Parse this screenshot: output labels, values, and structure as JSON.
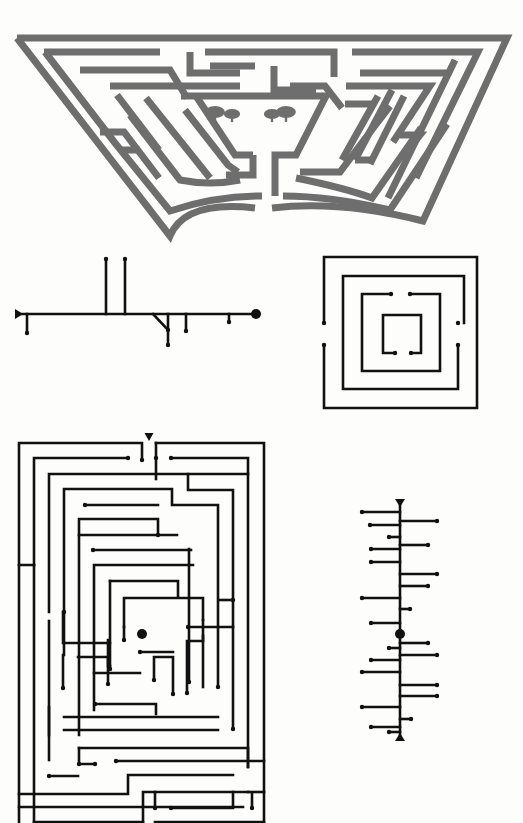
{
  "page": {
    "width": 523,
    "height": 823,
    "background": "#fdfdfc"
  },
  "colors": {
    "hedge": "#6e6e6e",
    "ink": "#111111"
  },
  "figures": [
    {
      "id": "hedge-maze-trapezoid",
      "label": "Trapezoidal hedge maze with two trees at centre",
      "stroke_width": 7,
      "paths": [
        "M17,38 L507,38 L423,221 Q340,200 272,208",
        "M255,208 Q185,200 170,236 L17,38",
        "M44,52 L160,52",
        "M190,52 L190,73 L240,73",
        "M205,52 L334,52 L334,77",
        "M274,66 L274,90 L316,90",
        "M210,66 L255,66",
        "M352,52 L478,52 L416,178",
        "M360,73 L450,73",
        "M80,70 L170,70 L187,98",
        "M45,52 L115,143 L170,211 Q215,196 262,196",
        "M283,196 Q330,196 390,210 L447,124",
        "M110,86 L240,86",
        "M290,86 L325,86 L342,108",
        "M346,86 L430,86 L393,142",
        "M117,95 L159,150",
        "M130,115 L180,180 Q210,186 240,180",
        "M185,110 L228,165 L238,172",
        "M181,96 L326,96 L296,155 L275,155 L275,196",
        "M253,155 L253,175 L226,175",
        "M196,96 L235,155 L253,155",
        "M146,98 L210,178",
        "M300,172 L340,172 L364,140 L390,106",
        "M296,178 Q345,188 372,198 L421,128",
        "M345,104 L372,104",
        "M378,96 L342,160",
        "M392,90 L355,160",
        "M404,96 L370,164",
        "M455,60 L388,198",
        "M100,132 L124,132 L159,178",
        "M120,150 L140,150",
        "M355,160 L370,160",
        "M400,135 L420,135 L408,150"
      ],
      "trees": [
        {
          "x": 215,
          "y": 112,
          "size": 11
        },
        {
          "x": 232,
          "y": 114,
          "size": 9
        },
        {
          "x": 272,
          "y": 114,
          "size": 9
        },
        {
          "x": 286,
          "y": 112,
          "size": 11
        }
      ]
    },
    {
      "id": "tree-diagram-horizontal",
      "label": "Network diagram of a simple maze",
      "trunk": {
        "x1": 19,
        "y1": 314,
        "x2": 256,
        "y2": 314
      },
      "start_marker": {
        "type": "triangle-right",
        "x": 19,
        "y": 314
      },
      "goal_marker": {
        "type": "dot",
        "x": 256,
        "y": 314,
        "r": 5
      },
      "branches": [
        {
          "x1": 27,
          "y1": 314,
          "x2": 27,
          "y2": 333
        },
        {
          "x1": 106,
          "y1": 314,
          "x2": 106,
          "y2": 259
        },
        {
          "x1": 125,
          "y1": 314,
          "x2": 125,
          "y2": 259
        },
        {
          "x1": 153,
          "y1": 314,
          "x2": 168,
          "y2": 330
        },
        {
          "x1": 168,
          "y1": 314,
          "x2": 168,
          "y2": 345
        },
        {
          "x1": 186,
          "y1": 314,
          "x2": 186,
          "y2": 331
        },
        {
          "x1": 229,
          "y1": 314,
          "x2": 229,
          "y2": 322
        }
      ]
    },
    {
      "id": "square-spiral-maze",
      "label": "Concentric square maze",
      "paths": [
        "M324,323 L324,257 L477,257 L477,408 L324,408 L324,345",
        "M464,323 L464,276 L343,276 L343,389 L458,389 L458,345",
        "M391,294 L362,294 L362,371 L440,371 L440,294 L410,294",
        "M395,353 L383,353 L383,315 L421,315 L421,353 L411,353"
      ],
      "end_dots": [
        [
          324,
          323
        ],
        [
          324,
          345
        ],
        [
          458,
          323
        ],
        [
          458,
          345
        ],
        [
          391,
          294
        ],
        [
          410,
          294
        ],
        [
          395,
          353
        ],
        [
          411,
          353
        ]
      ]
    },
    {
      "id": "rectangular-maze",
      "label": "Large rectangular maze with central goal",
      "entrance_marker": {
        "type": "triangle-down",
        "x": 149,
        "y": 437
      },
      "goal_marker": {
        "type": "dot",
        "x": 142,
        "y": 634,
        "r": 5
      },
      "paths": [
        "M142,460 L142,443 L19,443 L19,565 L34,565",
        "M156,443 L156,479",
        "M156,443 L264,443 L264,822",
        "M34,565 L34,822",
        "M19,565 L19,822",
        "M128,458 L34,458 L34,565",
        "M171,458 L248,458 L248,767",
        "M49,612 L49,474 L248,474",
        "M188,474 L188,490 L233,490 L233,729",
        "M64,655 L64,489 L172,489 L172,505 L218,505 L218,687",
        "M85,505 L158,505",
        "M79,735 L79,519 L158,519 L158,535",
        "M79,535 L177,535",
        "M93,550 L191,550",
        "M94,710 L94,565 L193,565",
        "M110,581 L178,581 L178,597",
        "M110,581 L110,669",
        "M124,627 L124,598 L203,598 L203,620",
        "M124,627 L124,640",
        "M63,612 L63,643 L110,643",
        "M63,655 L63,688",
        "M78,657 L108,657 L108,684",
        "M108,640 L108,666 L110,666",
        "M94,673 L140,673",
        "M154,680 L154,657 L173,657 L173,694",
        "M187,693 L187,641 L203,641 L203,636",
        "M156,714 L156,704 L95,704",
        "M64,717 L218,717",
        "M64,730 L218,730",
        "M79,748 L248,748 L248,767",
        "M49,760 L49,621",
        "M49,776 L78,776",
        "M79,748 L79,764 L95,764",
        "M116,761 L264,761",
        "M19,794 L128,794 L128,775 L233,775",
        "M19,807 L243,807",
        "M143,822 L143,792 L248,792",
        "M155,792 L155,808",
        "M171,808 L233,808 L233,792",
        "M248,792 L264,792",
        "M252,793 L252,808",
        "M34,822 L143,822",
        "M155,822 L264,822",
        "M189,549 L189,682",
        "M203,620 L203,687",
        "M233,600 L219,600",
        "M188,627 L233,627",
        "M173,652 L140,652",
        "M49,707 L49,735"
      ],
      "end_dots": [
        [
          142,
          460
        ],
        [
          128,
          458
        ],
        [
          156,
          458
        ],
        [
          171,
          458
        ],
        [
          85,
          505
        ],
        [
          158,
          535
        ],
        [
          93,
          550
        ],
        [
          64,
          612
        ],
        [
          110,
          669
        ],
        [
          124,
          640
        ],
        [
          63,
          688
        ],
        [
          108,
          684
        ],
        [
          154,
          680
        ],
        [
          173,
          694
        ],
        [
          187,
          693
        ],
        [
          95,
          704
        ],
        [
          49,
          776
        ],
        [
          95,
          764
        ],
        [
          116,
          761
        ],
        [
          233,
          729
        ],
        [
          218,
          687
        ],
        [
          233,
          600
        ],
        [
          188,
          627
        ],
        [
          189,
          682
        ],
        [
          140,
          652
        ],
        [
          155,
          808
        ],
        [
          171,
          808
        ],
        [
          252,
          808
        ],
        [
          79,
          764
        ]
      ]
    },
    {
      "id": "tree-diagram-vertical",
      "label": "Network diagram of the rectangular maze",
      "trunk": {
        "x1": 400,
        "y1": 503,
        "x2": 400,
        "y2": 737
      },
      "start_marker": {
        "type": "triangle-down",
        "x": 400,
        "y": 503
      },
      "goal_marker": {
        "type": "dot",
        "x": 400,
        "y": 634,
        "r": 5
      },
      "end_marker": {
        "type": "triangle-up",
        "x": 400,
        "y": 737
      },
      "branches": [
        {
          "y": 512,
          "side": "L",
          "end_x": 362
        },
        {
          "y": 521,
          "side": "R",
          "end_x": 437
        },
        {
          "y": 525,
          "side": "L",
          "end_x": 370
        },
        {
          "y": 537,
          "side": "L",
          "end_x": 389
        },
        {
          "y": 545,
          "side": "R",
          "end_x": 428
        },
        {
          "y": 549,
          "side": "L",
          "end_x": 371
        },
        {
          "y": 562,
          "side": "L",
          "end_x": 371
        },
        {
          "y": 574,
          "side": "R",
          "end_x": 437
        },
        {
          "y": 586,
          "side": "R",
          "end_x": 428
        },
        {
          "y": 598,
          "side": "L",
          "end_x": 362
        },
        {
          "y": 609,
          "side": "R",
          "end_x": 410
        },
        {
          "y": 623,
          "side": "L",
          "end_x": 371
        },
        {
          "y": 643,
          "side": "R",
          "end_x": 428
        },
        {
          "y": 648,
          "side": "L",
          "end_x": 389
        },
        {
          "y": 655,
          "side": "R",
          "end_x": 437
        },
        {
          "y": 660,
          "side": "L",
          "end_x": 371
        },
        {
          "y": 672,
          "side": "L",
          "end_x": 362
        },
        {
          "y": 685,
          "side": "R",
          "end_x": 437
        },
        {
          "y": 696,
          "side": "R",
          "end_x": 437
        },
        {
          "y": 707,
          "side": "L",
          "end_x": 362
        },
        {
          "y": 719,
          "side": "R",
          "end_x": 411
        },
        {
          "y": 727,
          "side": "L",
          "end_x": 371
        },
        {
          "y": 732,
          "side": "L",
          "end_x": 389
        }
      ]
    }
  ]
}
